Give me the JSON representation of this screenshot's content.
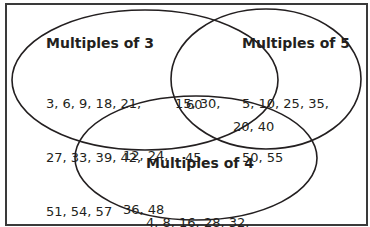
{
  "diagram": {
    "type": "venn",
    "sets": [
      {
        "id": "A",
        "label": "Multiples of 3",
        "only": [
          "3",
          "6",
          "9",
          "18",
          "21",
          "27",
          "33",
          "39",
          "42",
          "51",
          "54",
          "57"
        ],
        "lines": [
          "3, 6, 9, 18, 21,",
          "27, 33, 39, 42,",
          "51, 54, 57"
        ]
      },
      {
        "id": "B",
        "label": "Multiples of 5",
        "only": [
          "5",
          "10",
          "25",
          "35",
          "50",
          "55"
        ],
        "lines": [
          "5, 10, 25, 35,",
          "50, 55"
        ]
      },
      {
        "id": "C",
        "label": "Multiples of 4",
        "only": [
          "4",
          "8",
          "16",
          "28",
          "32",
          "44",
          "52",
          "56"
        ],
        "lines": [
          "4, 8, 16, 28, 32,",
          "44, 52, 56"
        ]
      }
    ],
    "intersections": {
      "A_B": {
        "values": [
          "15",
          "30",
          "45"
        ],
        "lines": [
          "15, 30,",
          "45"
        ]
      },
      "A_C": {
        "values": [
          "12",
          "24",
          "36",
          "48"
        ],
        "lines": [
          "12, 24,",
          "36, 48"
        ]
      },
      "B_C": {
        "values": [
          "20",
          "40"
        ],
        "lines": [
          "20, 40"
        ]
      },
      "A_B_C": {
        "values": [
          "60"
        ],
        "lines": [
          "60"
        ]
      }
    },
    "stroke_color": "#231f20",
    "text_color": "#231f20"
  }
}
